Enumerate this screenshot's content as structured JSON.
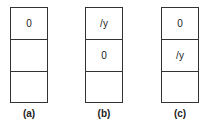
{
  "panels": [
    {
      "label": "(a)",
      "cells": [
        "0",
        "",
        ""
      ]
    },
    {
      "label": "(b)",
      "cells": [
        "/y",
        "0",
        ""
      ]
    },
    {
      "label": "(c)",
      "cells": [
        "0",
        "/y",
        ""
      ]
    }
  ]
}
